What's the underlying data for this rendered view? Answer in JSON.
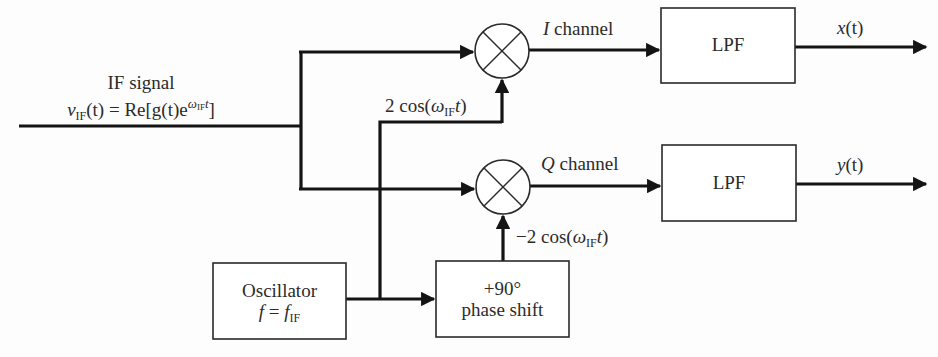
{
  "diagram": {
    "input": {
      "label_line1": "IF signal",
      "label_line2_parts": {
        "v": "v",
        "v_sub": "IF",
        "mid": "(t) = Re[g(t)e",
        "exp_omega": "ω",
        "exp_sub": "IF",
        "exp_t": "t",
        "close": "]"
      }
    },
    "mixers": [
      {
        "id": "mixer-i",
        "symbol": "multiply",
        "cx": 502,
        "cy": 51,
        "r": 27
      },
      {
        "id": "mixer-q",
        "symbol": "multiply",
        "cx": 503,
        "cy": 187,
        "r": 27
      }
    ],
    "channels": {
      "i": {
        "italic": "I",
        "label": " channel"
      },
      "q": {
        "italic": "Q",
        "label": " channel"
      }
    },
    "lo_labels": {
      "i": {
        "prefix": "2 cos(",
        "omega": "ω",
        "sub": "IF",
        "t": "t",
        "close": ")"
      },
      "q": {
        "prefix": "−2 cos(",
        "omega": "ω",
        "sub": "IF",
        "t": "t",
        "close": ")"
      }
    },
    "blocks": {
      "lpf_i": {
        "label": "LPF"
      },
      "lpf_q": {
        "label": "LPF"
      },
      "oscillator": {
        "line1": "Oscillator",
        "f": "f",
        "eq": " = ",
        "f2": "f",
        "sub": "IF"
      },
      "phase_shift": {
        "line1": "+90°",
        "line2": "phase shift"
      }
    },
    "outputs": {
      "i": {
        "name": "x",
        "arg": "(t)"
      },
      "q": {
        "name": "y",
        "arg": "(t)"
      }
    },
    "colors": {
      "line": "#141414",
      "box_border": "#2a2a2a",
      "text": "#2b2b2b",
      "background": "#fdfdfd"
    }
  }
}
